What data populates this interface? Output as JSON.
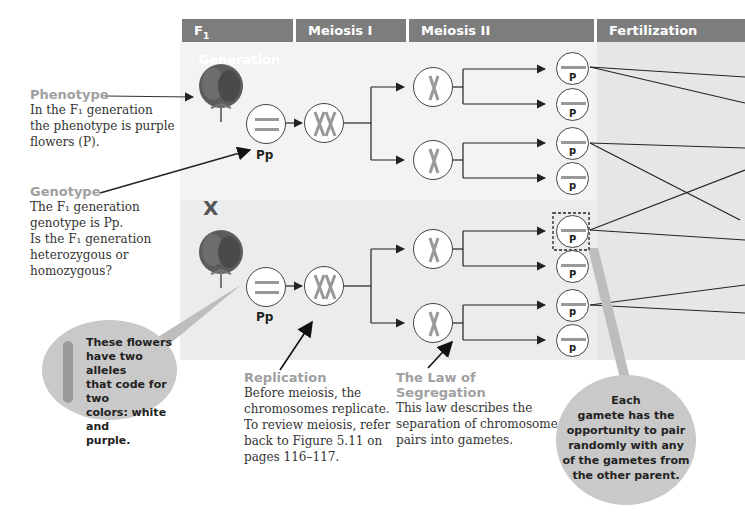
{
  "headers": [
    {
      "label": "F",
      "sub": "1",
      "rest": " Generation"
    },
    {
      "label": "Meiosis I"
    },
    {
      "label": "Meiosis II"
    },
    {
      "label": "Fertilization"
    }
  ],
  "phenotype": {
    "title": "Phenotype",
    "lines": [
      "In the F₁ generation",
      "the phenotype is purple",
      "flowers (P)."
    ]
  },
  "genotype": {
    "title": "Genotype",
    "lines": [
      "The F₁ generation",
      "genotype is Pp.",
      "Is the F₁ generation",
      "heterozygous or",
      "homozygous?"
    ]
  },
  "cross_symbol": "X",
  "parent_genotype_label": "Pp",
  "gamete_labels": [
    "P",
    "P",
    "p",
    "p",
    "P",
    "P",
    "p",
    "p"
  ],
  "alleles_bubble": {
    "lines": [
      "These flowers",
      "have two alleles",
      "that code for two",
      "colors: white and",
      "purple."
    ]
  },
  "replication": {
    "title": "Replication",
    "lines": [
      "Before meiosis, the",
      "chromosomes replicate.",
      "To review meiosis, refer",
      "back to Figure 5.11 on",
      "pages 116–117."
    ]
  },
  "segregation": {
    "title": "The Law of Segregation",
    "lines": [
      "This law describes the",
      "separation of chromosome",
      "pairs into gametes."
    ]
  },
  "gamete_bubble": {
    "lines": [
      "Each",
      "gamete has the",
      "opportunity to pair",
      "randomly with any",
      "of the gametes from",
      "the other parent."
    ]
  },
  "colors": {
    "header_bg": "#7d7d7d",
    "title_gray": "#a0a0a0",
    "bubble_gray": "#c9c9c9"
  }
}
